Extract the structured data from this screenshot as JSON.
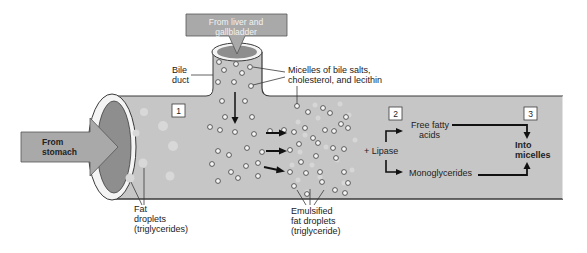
{
  "colors": {
    "pipe": "#c6c6c6",
    "pipe_edge": "#3a3a3a",
    "inner_dark": "#8e8e8e",
    "rim": "#f4f4f4",
    "arrow_fill": "#a9a9a9",
    "arrow_text": "#f2f2f2",
    "text": "#222222"
  },
  "labels": {
    "from_liver": [
      "From liver and",
      "gallbladder"
    ],
    "from_stomach": [
      "From",
      "stomach"
    ],
    "bile_duct": [
      "Bile",
      "duct"
    ],
    "micelles": [
      "Micelles of bile salts,",
      "cholesterol, and lecithin"
    ],
    "fat_droplets": [
      "Fat",
      "droplets",
      "(triglycerides)"
    ],
    "emulsified": [
      "Emulsified",
      "fat droplets",
      "(triglyceride)"
    ],
    "lipase": "+ Lipase",
    "free_fatty_acids": [
      "Free fatty",
      "acids"
    ],
    "monoglycerides": "Monoglycerides",
    "into_micelles": [
      "Into",
      "micelles"
    ]
  },
  "steps": [
    "1",
    "2",
    "3"
  ]
}
